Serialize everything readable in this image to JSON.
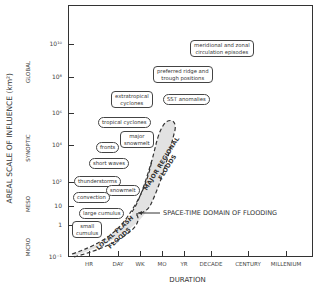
{
  "figure": {
    "y_axis_title": "AREAL SCALE OF INFLUENCE (km²)",
    "x_axis_title": "DURATION",
    "y_ticks": [
      {
        "label": "10¹⁰",
        "y": 44
      },
      {
        "label": "10⁸",
        "y": 77
      },
      {
        "label": "10⁶",
        "y": 113
      },
      {
        "label": "10⁴",
        "y": 145
      },
      {
        "label": "10²",
        "y": 182
      },
      {
        "label": "10",
        "y": 206
      },
      {
        "label": "1",
        "y": 225
      },
      {
        "label": "10⁻¹",
        "y": 257
      }
    ],
    "y_categories": [
      {
        "label": "GLOBAL",
        "y": 72
      },
      {
        "label": "SYNOPTIC",
        "y": 148
      },
      {
        "label": "MESO",
        "y": 204
      },
      {
        "label": "MICRO",
        "y": 247
      }
    ],
    "x_ticks": [
      {
        "label": "HR",
        "x": 89
      },
      {
        "label": "DAY",
        "x": 118
      },
      {
        "label": "WK",
        "x": 140
      },
      {
        "label": "MO",
        "x": 162
      },
      {
        "label": "YR",
        "x": 184
      },
      {
        "label": "DECADE",
        "x": 211
      },
      {
        "label": "CENTURY",
        "x": 248
      },
      {
        "label": "MILLENIUM",
        "x": 286
      }
    ],
    "phenomena": [
      {
        "label": "meridional and zonal circulation episodes",
        "line1": "meridional and zonal",
        "line2": "circulation episodes"
      },
      {
        "label": "preferred ridge and trough positions",
        "line1": "preferred ridge and",
        "line2": "trough positions"
      },
      {
        "label": "SST anomalies"
      },
      {
        "label": "extratropical cyclones",
        "line1": "extratropical",
        "line2": "cyclones"
      },
      {
        "label": "tropical cyclones"
      },
      {
        "label": "major snowmelt",
        "line1": "major",
        "line2": "snowmelt"
      },
      {
        "label": "fronts"
      },
      {
        "label": "short waves"
      },
      {
        "label": "thunderstorms"
      },
      {
        "label": "snowmelt"
      },
      {
        "label": "convection"
      },
      {
        "label": "large cumulus"
      },
      {
        "label": "small cumulus",
        "line1": "small",
        "line2": "cumulus"
      }
    ],
    "flood_regions": {
      "major": "MAJOR REGIONAL FLOODS",
      "major_line1": "MAJOR REGIONAL",
      "major_line2": "FLOODS",
      "local": "LOCAL FLASH FLOODS",
      "local_line1": "LOCAL FLASH",
      "local_line2": "FLOODS",
      "domain": "SPACE-TIME DOMAIN OF FLOODING"
    },
    "colors": {
      "line": "#333333",
      "shade": "#e2e2e2",
      "text": "#333333"
    }
  }
}
